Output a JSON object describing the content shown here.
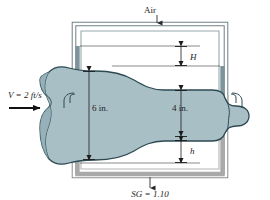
{
  "figure": {
    "name": "venturi-meter-with-manometers",
    "background_color": "#ffffff"
  },
  "labels": {
    "air": "Air",
    "velocity": "V = 2 ft/s",
    "inlet_diameter": "6 in.",
    "throat_diameter": "4 in.",
    "upper_height": "H",
    "lower_height": "h",
    "specific_gravity": "SG = 1.10"
  },
  "colors": {
    "pipe_fluid": "#a8bfc6",
    "pipe_outline": "#2d4a52",
    "manometer_fluid_dark": "#7e949c",
    "manometer_fluid_gray": "#a9a9a9",
    "tube_outline": "#5a6a70",
    "tube_gray_outline": "#8e8e8e",
    "leader_line": "#2a2a2a",
    "text": "#1c1c1c"
  },
  "values": {
    "inlet_velocity_ft_per_s": 2,
    "inlet_diameter_in": 6,
    "throat_diameter_in": 4,
    "manometer_fluid_sg": 1.1
  },
  "annotations": [
    {
      "name": "air-arrow",
      "direction": "down",
      "target": "upper manometer open top"
    },
    {
      "name": "flow-arrow",
      "direction": "right",
      "target": "pipe inlet"
    },
    {
      "name": "sg-arrow",
      "direction": "up",
      "target": "lower manometer bottom"
    },
    {
      "name": "H-dimension",
      "type": "double-headed-vertical"
    },
    {
      "name": "h-dimension",
      "type": "double-headed-vertical"
    },
    {
      "name": "inlet-diameter-dimension",
      "type": "double-headed-vertical"
    },
    {
      "name": "throat-diameter-dimension",
      "type": "double-headed-vertical"
    }
  ]
}
